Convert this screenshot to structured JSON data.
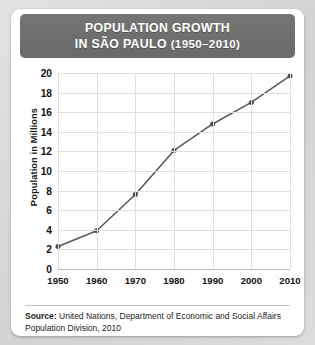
{
  "header": {
    "title_line1": "POPULATION GROWTH",
    "title_line2_main": "IN SÃO PAULO",
    "title_line2_years": "(1950–2010)",
    "bar_color": "#6f6f6e",
    "text_color": "#ffffff"
  },
  "source": {
    "label": "Source:",
    "text": " United Nations, Department of Economic and Social Affairs Population Division, 2010"
  },
  "chart_data": {
    "type": "line",
    "title": "POPULATION GROWTH IN SÃO PAULO (1950–2010)",
    "xlabel": "",
    "ylabel": "Population in Millions",
    "categories": [
      "1950",
      "1960",
      "1970",
      "1980",
      "1990",
      "2000",
      "2010"
    ],
    "x": [
      1950,
      1960,
      1970,
      1980,
      1990,
      2000,
      2010
    ],
    "values": [
      2.3,
      3.9,
      7.6,
      12.1,
      14.8,
      17.0,
      19.7
    ],
    "series": [
      {
        "name": "Population in Millions",
        "values": [
          2.3,
          3.9,
          7.6,
          12.1,
          14.8,
          17.0,
          19.7
        ]
      }
    ],
    "ylim": [
      0,
      20
    ],
    "xlim": [
      1950,
      2010
    ],
    "yticks": [
      0,
      2,
      4,
      6,
      8,
      10,
      12,
      14,
      16,
      18,
      20
    ],
    "ytick_labels": [
      "0",
      "2",
      "4",
      "6",
      "8",
      "10",
      "12",
      "14",
      "16",
      "18",
      "20"
    ],
    "xticks": [
      1950,
      1960,
      1970,
      1980,
      1990,
      2000,
      2010
    ],
    "xtick_labels": [
      "1950",
      "1960",
      "1970",
      "1980",
      "1990",
      "2000",
      "2010"
    ],
    "grid": true,
    "legend": false,
    "line_color": "#5a5a58",
    "marker_color": "#4a4a48",
    "grid_color": "#dededc",
    "plot_background": "#ffffff"
  }
}
